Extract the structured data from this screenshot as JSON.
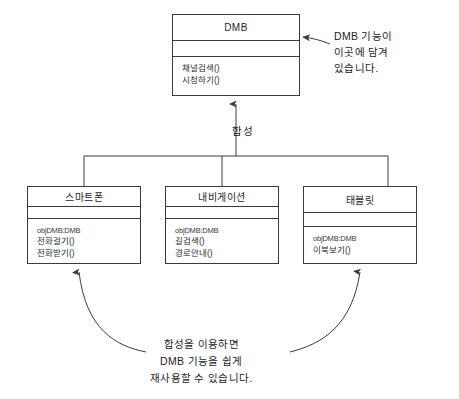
{
  "diagram": {
    "title_text": "DMB composition UML class diagram",
    "relationship_label": "합성",
    "stroke_color": "#3a3a3a",
    "text_color": "#232323"
  },
  "classes": {
    "dmb": {
      "name": "DMB",
      "attributes": [],
      "operations": [
        "채널검색()",
        "시청하기()"
      ]
    },
    "smartphone": {
      "name": "스마트폰",
      "attributes": [],
      "operations": [
        "objDMB:DMB",
        "전화걸기()",
        "전화받기()"
      ]
    },
    "navigation": {
      "name": "내비게이션",
      "attributes": [],
      "operations": [
        "objDMB:DMB",
        "길검색()",
        "경로안내()"
      ]
    },
    "tablet": {
      "name": "태블릿",
      "attributes": [],
      "operations": [
        "objDMB:DMB",
        "이북보기()"
      ]
    }
  },
  "annotations": {
    "top_note": {
      "lines": [
        "DMB 기능이",
        "이곳에 담겨",
        "있습니다."
      ]
    },
    "bottom_note": {
      "lines": [
        "합성을 이용하면",
        "DMB 기능을 쉽게",
        "재사용할 수 있습니다."
      ]
    }
  }
}
